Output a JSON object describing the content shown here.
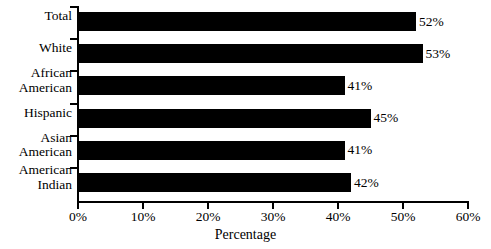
{
  "chart_data": {
    "type": "bar",
    "orientation": "horizontal",
    "title": "",
    "xlabel": "Percentage",
    "ylabel": "",
    "xlim": [
      0,
      60
    ],
    "grid": false,
    "legend": null,
    "categories": [
      "Total",
      "White",
      "African American",
      "Hispanic",
      "Asian American",
      "American Indian"
    ],
    "category_lines": [
      [
        "Total"
      ],
      [
        "White"
      ],
      [
        "African",
        "American"
      ],
      [
        "Hispanic"
      ],
      [
        "Asian",
        "American"
      ],
      [
        "American",
        "Indian"
      ]
    ],
    "values": [
      52,
      53,
      41,
      45,
      41,
      42
    ],
    "value_labels": [
      "52%",
      "53%",
      "41%",
      "45%",
      "41%",
      "42%"
    ],
    "x_ticks": [
      0,
      10,
      20,
      30,
      40,
      50,
      60
    ],
    "x_tick_labels": [
      "0%",
      "10%",
      "20%",
      "30%",
      "40%",
      "50%",
      "60%"
    ],
    "bar_color": "#000000",
    "background_color": "#FFFFFF",
    "axis_color": "#000000"
  }
}
